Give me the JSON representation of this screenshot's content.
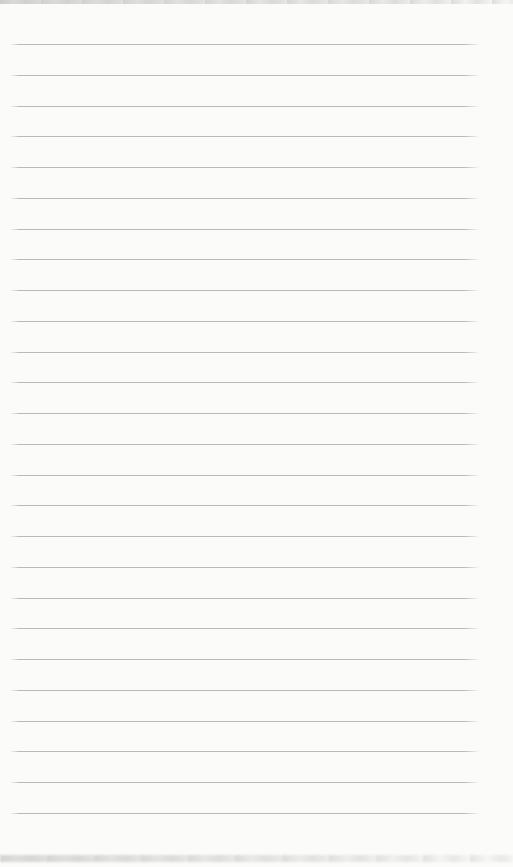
{
  "page": {
    "background_color": "#fbfbf9",
    "rule_line_color": "#b2b2b0",
    "edge_shadow_color": "#c8c8c6",
    "ruled_lines": {
      "count": 26,
      "first_line_top_px": 44,
      "spacing_px": 30.75,
      "left_px": 10,
      "width_px": 468
    }
  }
}
